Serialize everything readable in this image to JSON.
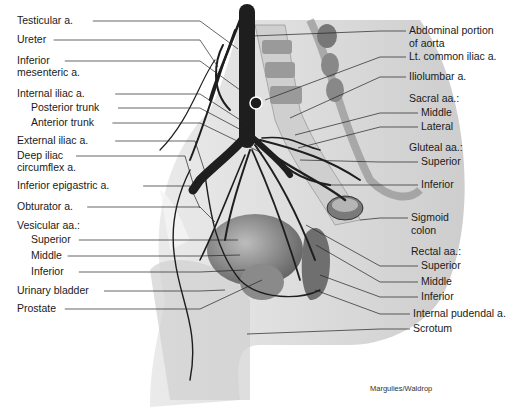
{
  "figure": {
    "credit": "Margulies/Waldrop",
    "left_labels": [
      {
        "text": "Testicular a.",
        "x": 17,
        "y": 14,
        "lx": 238,
        "ly": 49
      },
      {
        "text": "Ureter",
        "x": 17,
        "y": 33,
        "lx": 218,
        "ly": 67
      },
      {
        "text": "Inferior",
        "x": 17,
        "y": 54,
        "lx": 240,
        "ly": 90
      },
      {
        "text": "mesenteric a.",
        "x": 17,
        "y": 66,
        "lx": null,
        "ly": null
      },
      {
        "text": "Internal iliac a.",
        "x": 17,
        "y": 87,
        "lx": 248,
        "ly": 125
      },
      {
        "text": "Posterior trunk",
        "x": 31,
        "y": 101,
        "lx": 260,
        "ly": 140
      },
      {
        "text": "Anterior trunk",
        "x": 31,
        "y": 116,
        "lx": 262,
        "ly": 153
      },
      {
        "text": "External iliac a.",
        "x": 17,
        "y": 134,
        "lx": 205,
        "ly": 172
      },
      {
        "text": "Deep iliac",
        "x": 17,
        "y": 149,
        "lx": 195,
        "ly": 190
      },
      {
        "text": "circumflex a.",
        "x": 17,
        "y": 161,
        "lx": null,
        "ly": null
      },
      {
        "text": "Inferior epigastric a.",
        "x": 17,
        "y": 179,
        "lx": 200,
        "ly": 208
      },
      {
        "text": "Obturator a.",
        "x": 17,
        "y": 200,
        "lx": 215,
        "ly": 222
      },
      {
        "text": "Vesicular aa.:",
        "x": 17,
        "y": 219,
        "lx": null,
        "ly": null
      },
      {
        "text": "Superior",
        "x": 31,
        "y": 233,
        "lx": 238,
        "ly": 240
      },
      {
        "text": "Middle",
        "x": 31,
        "y": 249,
        "lx": 240,
        "ly": 255
      },
      {
        "text": "Inferior",
        "x": 31,
        "y": 265,
        "lx": 245,
        "ly": 270
      },
      {
        "text": "Urinary bladder",
        "x": 17,
        "y": 284,
        "lx": 225,
        "ly": 290
      },
      {
        "text": "Prostate",
        "x": 17,
        "y": 302,
        "lx": 262,
        "ly": 280
      }
    ],
    "right_labels": [
      {
        "text": "Abdominal portion",
        "x": 409,
        "y": 24,
        "lx": 252,
        "ly": 36
      },
      {
        "text": "of aorta",
        "x": 409,
        "y": 37,
        "lx": null,
        "ly": null
      },
      {
        "text": "Lt. common iliac a.",
        "x": 409,
        "y": 50,
        "lx": 265,
        "ly": 100
      },
      {
        "text": "Iliolumbar a.",
        "x": 409,
        "y": 70,
        "lx": 290,
        "ly": 118
      },
      {
        "text": "Sacral aa.:",
        "x": 409,
        "y": 92,
        "lx": null,
        "ly": null
      },
      {
        "text": "Middle",
        "x": 421,
        "y": 106,
        "lx": 295,
        "ly": 135
      },
      {
        "text": "Lateral",
        "x": 421,
        "y": 120,
        "lx": 298,
        "ly": 148
      },
      {
        "text": "Gluteal aa.:",
        "x": 409,
        "y": 141,
        "lx": null,
        "ly": null
      },
      {
        "text": "Superior",
        "x": 421,
        "y": 155,
        "lx": 300,
        "ly": 160
      },
      {
        "text": "Inferior",
        "x": 421,
        "y": 178,
        "lx": 325,
        "ly": 185
      },
      {
        "text": "Sigmoid",
        "x": 411,
        "y": 211,
        "lx": 360,
        "ly": 220
      },
      {
        "text": "colon",
        "x": 411,
        "y": 224,
        "lx": null,
        "ly": null
      },
      {
        "text": "Rectal aa.:",
        "x": 411,
        "y": 245,
        "lx": null,
        "ly": null
      },
      {
        "text": "Superior",
        "x": 421,
        "y": 259,
        "lx": 306,
        "ly": 225
      },
      {
        "text": "Middle",
        "x": 421,
        "y": 275,
        "lx": 316,
        "ly": 245
      },
      {
        "text": "Inferior",
        "x": 421,
        "y": 290,
        "lx": 320,
        "ly": 275
      },
      {
        "text": "Internal pudendal a.",
        "x": 413,
        "y": 307,
        "lx": 315,
        "ly": 290
      },
      {
        "text": "Scrotum",
        "x": 413,
        "y": 322,
        "lx": 247,
        "ly": 334
      }
    ]
  }
}
